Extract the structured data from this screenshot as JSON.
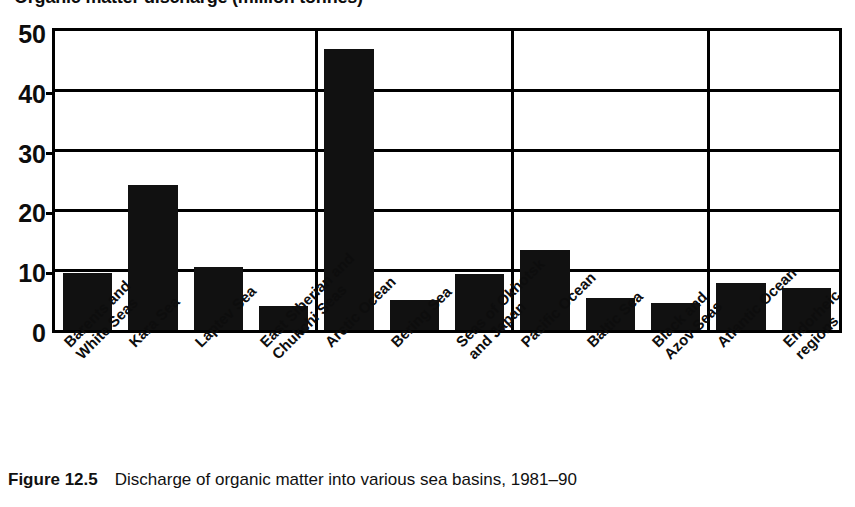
{
  "chart_data": {
    "type": "bar",
    "title": "Organic matter discharge (million tonnes)",
    "xlabel": "",
    "ylabel": "",
    "ylim": [
      0,
      50
    ],
    "yticks": [
      0,
      10,
      20,
      30,
      40,
      50
    ],
    "ytick_labels": [
      "0",
      "10",
      "20",
      "30",
      "40",
      "50"
    ],
    "grid": true,
    "legend": "none",
    "bar_color": "#111111",
    "axis_color": "#000000",
    "categories": [
      "Barents and White Seas",
      "Kara Sea",
      "Laptev Sea",
      "East Siberian and Chukchi Seas",
      "Arctic Ocean",
      "Bering Sea",
      "Seas of Okhotsk and Japan",
      "Pacific Ocean",
      "Baltic Sea",
      "Black and Azov Seas",
      "Atlantic Ocean",
      "Endorheic regions"
    ],
    "category_lines": [
      [
        "Barents and",
        "White Seas"
      ],
      [
        "Kara Sea"
      ],
      [
        "Laptev Sea"
      ],
      [
        "East Siberian and",
        "Chukchi Seas"
      ],
      [
        "Arctic Ocean"
      ],
      [
        "Bering Sea"
      ],
      [
        "Seas of Okhotsk",
        "and Japan"
      ],
      [
        "Pacific Ocean"
      ],
      [
        "Baltic Sea"
      ],
      [
        "Black and",
        "Azov Seas"
      ],
      [
        "Atlantic Ocean"
      ],
      [
        "Endorheic",
        "regions"
      ]
    ],
    "values": [
      9.5,
      24.3,
      10.5,
      4.0,
      47.0,
      5.0,
      9.4,
      13.3,
      5.4,
      4.6,
      7.8,
      7.0
    ],
    "group_dividers_after": [
      4,
      7,
      10
    ],
    "annotations": []
  },
  "caption": {
    "label": "Figure 12.5",
    "text": "Discharge of organic matter into various sea basins, 1981–90"
  }
}
